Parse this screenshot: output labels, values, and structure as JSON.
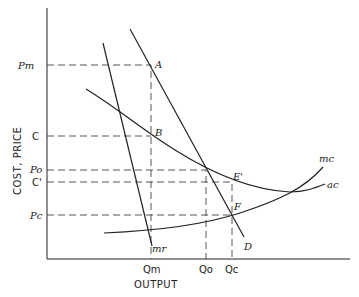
{
  "diagram": {
    "axes": {
      "x_label": "OUTPUT",
      "y_label": "COST, PRICE"
    },
    "y_ticks": {
      "pm": "Pm",
      "c": "C",
      "po": "Po",
      "c_prime": "C'",
      "pc": "Pc"
    },
    "x_ticks": {
      "qm": "Qm",
      "qo": "Qo",
      "qc": "Qc"
    },
    "points": {
      "a": "A",
      "b": "B",
      "e_prime": "E'",
      "f": "F"
    },
    "curves": {
      "demand": "D",
      "marginal_revenue": "mr",
      "marginal_cost": "mc",
      "average_cost": "ac"
    }
  }
}
